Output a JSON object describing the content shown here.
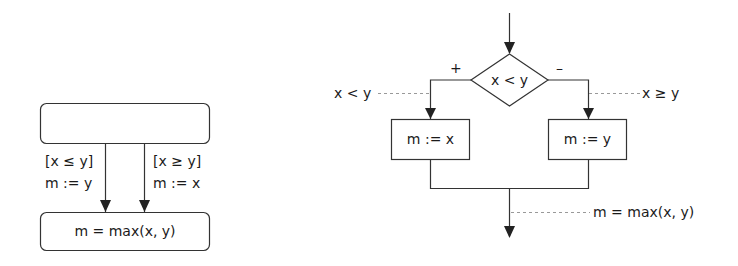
{
  "left_diagram": {
    "top_box_label": "",
    "left_edge": {
      "guard": "[x ≤ y]",
      "action": "m := y"
    },
    "right_edge": {
      "guard": "[x ≥ y]",
      "action": "m := x"
    },
    "bottom_box_label": "m = max(x, y)"
  },
  "right_diagram": {
    "decision": "x < y",
    "plus_label": "+",
    "minus_label": "–",
    "left_annotation": "x < y",
    "right_annotation": "x ≥ y",
    "left_box": "m := x",
    "right_box": "m := y",
    "bottom_annotation": "m = max(x, y)"
  },
  "colors": {
    "stroke": "#333333",
    "dashed": "#999999",
    "text": "#1a1a1a"
  }
}
